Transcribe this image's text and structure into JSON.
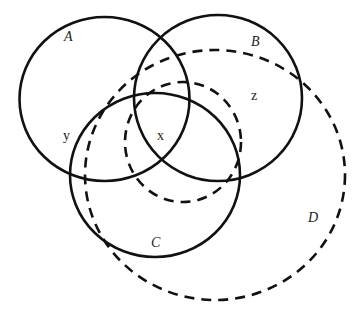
{
  "diagram": {
    "type": "venn",
    "sets": [
      {
        "id": "A",
        "label": "A",
        "style": "solid"
      },
      {
        "id": "B",
        "label": "B",
        "style": "solid"
      },
      {
        "id": "C",
        "label": "C",
        "style": "solid"
      },
      {
        "id": "D",
        "label": "D",
        "style": "dashed"
      },
      {
        "id": "inner",
        "label": "",
        "style": "dashed"
      }
    ],
    "points": [
      {
        "label": "x"
      },
      {
        "label": "y"
      },
      {
        "label": "z"
      }
    ],
    "colors": {
      "stroke": "#111111",
      "background": "#ffffff"
    }
  }
}
